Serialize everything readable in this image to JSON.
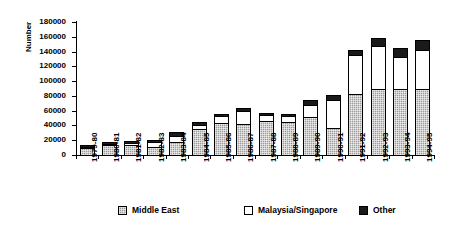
{
  "chart_data": {
    "type": "bar",
    "stacked": true,
    "title": "",
    "xlabel": "",
    "ylabel": "Number",
    "ylim": [
      0,
      180000
    ],
    "ytick_step": 20000,
    "yticks": [
      "0",
      "20000",
      "40000",
      "60000",
      "80000",
      "100000",
      "120000",
      "140000",
      "160000",
      "180000"
    ],
    "grid": false,
    "legend_position": "bottom",
    "categories": [
      "1979-80",
      "1980-81",
      "1981-82",
      "1982-83",
      "1983-84",
      "1984-85",
      "1985-86",
      "1986-87",
      "1987-88",
      "1988-89",
      "1989-90",
      "1990-91",
      "1991-92",
      "1992-93",
      "1993-94",
      "1994-95"
    ],
    "series": [
      {
        "name": "Middle East",
        "color": "#9a9a9a",
        "values": [
          9000,
          13000,
          14000,
          11000,
          18000,
          35000,
          44000,
          42000,
          46000,
          45000,
          52000,
          37000,
          82000,
          89000,
          89000,
          89000
        ]
      },
      {
        "name": "Malaysia/Singapore",
        "color": "#ffffff",
        "values": [
          1000,
          1500,
          1500,
          6000,
          8000,
          6000,
          9000,
          18000,
          8000,
          8000,
          16000,
          38000,
          53000,
          58000,
          44000,
          53000
        ]
      },
      {
        "name": "Other",
        "color": "#1a1a1a",
        "values": [
          500,
          2000,
          3000,
          3000,
          5000,
          4000,
          3000,
          3000,
          3000,
          3000,
          6000,
          6000,
          7000,
          12000,
          12000,
          14000
        ]
      }
    ],
    "legend": [
      {
        "label": "Middle East",
        "swatch": "pattern-gray"
      },
      {
        "label": "Malaysia/Singapore",
        "swatch": "white"
      },
      {
        "label": "Other",
        "swatch": "black"
      }
    ]
  }
}
